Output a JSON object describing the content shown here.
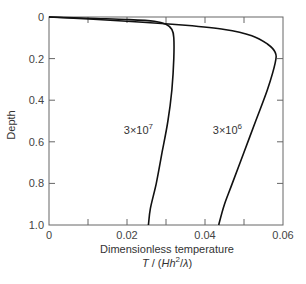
{
  "chart_data": {
    "type": "line",
    "title": "",
    "xlabel": "Dimensionless temperature",
    "xlabel_formula": "T / (Hh²/λ)",
    "ylabel": "Depth",
    "xlim": [
      0,
      0.06
    ],
    "ylim": [
      0,
      1.0
    ],
    "y_inverted": true,
    "grid": false,
    "x_ticks": [
      0,
      0.01,
      0.02,
      0.03,
      0.04,
      0.05,
      0.06
    ],
    "x_tick_labels": [
      "0",
      "",
      "0.02",
      "",
      "0.04",
      "",
      "0.06"
    ],
    "y_ticks": [
      0,
      0.2,
      0.4,
      0.6,
      0.8,
      1.0
    ],
    "y_tick_labels": [
      "0",
      "0.2",
      "0.4",
      "0.6",
      "0.8",
      "1.0"
    ],
    "series": [
      {
        "name": "3×10⁷",
        "label": "3×10",
        "label_exp": "7",
        "points": [
          [
            0,
            0
          ],
          [
            0.01,
            0.006
          ],
          [
            0.02,
            0.012
          ],
          [
            0.027,
            0.02
          ],
          [
            0.03,
            0.035
          ],
          [
            0.0315,
            0.06
          ],
          [
            0.032,
            0.1
          ],
          [
            0.032,
            0.2
          ],
          [
            0.0315,
            0.35
          ],
          [
            0.0305,
            0.5
          ],
          [
            0.029,
            0.65
          ],
          [
            0.0275,
            0.8
          ],
          [
            0.026,
            0.92
          ],
          [
            0.0255,
            1.0
          ]
        ]
      },
      {
        "name": "3×10⁶",
        "label": "3×10",
        "label_exp": "6",
        "points": [
          [
            0,
            0
          ],
          [
            0.02,
            0.02
          ],
          [
            0.035,
            0.04
          ],
          [
            0.045,
            0.06
          ],
          [
            0.052,
            0.09
          ],
          [
            0.056,
            0.13
          ],
          [
            0.058,
            0.17
          ],
          [
            0.058,
            0.22
          ],
          [
            0.056,
            0.35
          ],
          [
            0.053,
            0.5
          ],
          [
            0.05,
            0.65
          ],
          [
            0.047,
            0.8
          ],
          [
            0.045,
            0.9
          ],
          [
            0.0435,
            1.0
          ]
        ]
      }
    ]
  }
}
